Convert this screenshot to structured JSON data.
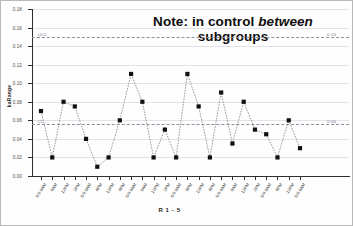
{
  "chart_data": {
    "type": "line",
    "title": "Note: in control between subgroups",
    "title_part1": "Note: in control ",
    "title_italic": "between",
    "title_part2": "subgroups",
    "xlabel": "R 1 - 5",
    "ylabel": "kaRange",
    "ylim": [
      0.0,
      0.18
    ],
    "ytick_values": [
      0.0,
      0.02,
      0.04,
      0.06,
      0.08,
      0.1,
      0.12,
      0.14,
      0.16,
      0.18
    ],
    "ytick_labels": [
      "0.00",
      "0.02",
      "0.04",
      "0.06",
      "0.08",
      "0.10",
      "0.12",
      "0.14",
      "0.16",
      "0.18"
    ],
    "grid": true,
    "legend": "none",
    "marker": "filled-square",
    "line_style": "dotted",
    "categories": [
      "6/9 8AM",
      "8AM",
      "12PM",
      "2PM",
      "6/9 8AM",
      "4PM",
      "12PM",
      "4PM",
      "6/9 8AM",
      "8AM",
      "12PM",
      "2PM",
      "6/9 8AM",
      "4PM",
      "12PM",
      "4PM",
      "6/9 8AM",
      "8AM",
      "12PM",
      "2PM",
      "6/9 8AM",
      "4PM",
      "12PM",
      "6/9 8AM"
    ],
    "values": [
      0.07,
      0.02,
      0.08,
      0.075,
      0.04,
      0.01,
      0.02,
      0.06,
      0.11,
      0.08,
      0.02,
      0.05,
      0.02,
      0.11,
      0.075,
      0.02,
      0.09,
      0.035,
      0.08,
      0.05,
      0.045,
      0.02,
      0.06,
      0.03
    ],
    "control_limits": [
      {
        "name": "UCL",
        "label": "UCL",
        "value": 0.15,
        "value_label": "0.15",
        "style": "dashed"
      },
      {
        "name": "CL",
        "label": "CL",
        "value": 0.056,
        "value_label": "0.06",
        "style": "dashed"
      }
    ]
  }
}
